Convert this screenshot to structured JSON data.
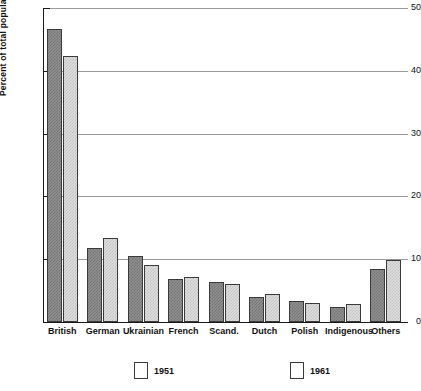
{
  "chart_data": {
    "type": "bar",
    "title": "",
    "xlabel": "",
    "ylabel": "Percent of total population",
    "ylim": [
      0,
      50
    ],
    "yticks": [
      0,
      10,
      20,
      30,
      40,
      50
    ],
    "ytick_labels": [
      "0",
      "10",
      "20",
      "30",
      "40",
      "50"
    ],
    "grid": "horizontal",
    "legend_position": "bottom",
    "categories": [
      "British",
      "German",
      "Ukrainian",
      "French",
      "Scand.",
      "Dutch",
      "Polish",
      "Indigenous",
      "Others"
    ],
    "series": [
      {
        "name": "1951",
        "color": "#8e8e8e",
        "values": [
          46.7,
          11.8,
          10.5,
          6.9,
          6.4,
          4.0,
          3.4,
          2.4,
          8.4
        ]
      },
      {
        "name": "1961",
        "color": "#dcdcdc",
        "values": [
          42.4,
          13.4,
          9.1,
          7.1,
          6.0,
          4.5,
          3.0,
          2.8,
          9.9
        ]
      }
    ]
  }
}
